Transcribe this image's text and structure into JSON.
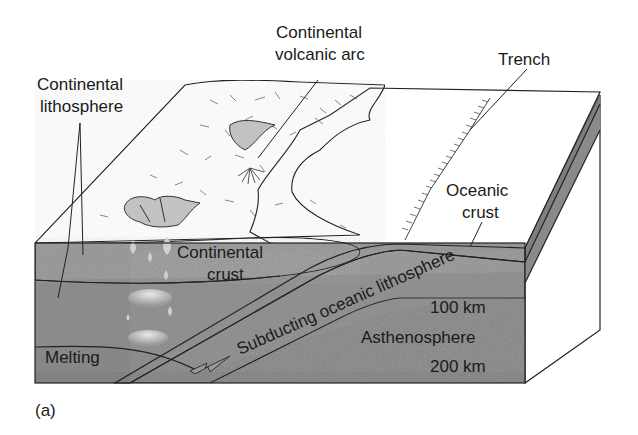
{
  "figure": {
    "panel_label": "(a)",
    "colors": {
      "background": "#ffffff",
      "continent_surface": "#a8a8a8",
      "ocean_surface": "#dcdcdc",
      "continental_crust": "#9a9a9a",
      "lithosphere": "#8e8e8e",
      "asthenosphere": "#858585",
      "subducting_slab": "#b4b4b4",
      "oceanic_crust_band": "#7a7a7a",
      "side_face": "#6e6e6e",
      "text": "#1a1a1a"
    }
  },
  "labels": {
    "continental_lithosphere": [
      "Continental",
      "lithosphere"
    ],
    "continental_volcanic_arc": [
      "Continental",
      "volcanic arc"
    ],
    "trench": "Trench",
    "oceanic_crust": [
      "Oceanic",
      "crust"
    ],
    "continental_crust": [
      "Continental",
      "crust"
    ],
    "subducting_oceanic_lithosphere": "Subducting oceanic lithosphere",
    "depth_100": "100 km",
    "asthenosphere": "Asthenosphere",
    "depth_200": "200 km",
    "melting": "Melting"
  },
  "icons": {
    "subduction_arrow": "arrow-left-down"
  }
}
